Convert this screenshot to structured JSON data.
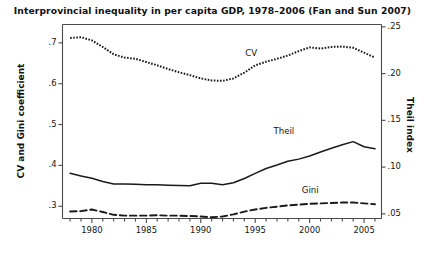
{
  "chart_data": {
    "type": "line",
    "title": "Interprovincial inequality in per capita GDP, 1978–2006 (Fan and Sun 2007)",
    "xlabel": "",
    "ylabel": "CV and Gini coefficient",
    "ylabel_right": "Theil index",
    "xlim": [
      1977.3,
      2006.6
    ],
    "ylim": [
      0.27,
      0.745
    ],
    "ylim_right": [
      0.045,
      0.2525
    ],
    "grid": false,
    "legend": "inline-labels",
    "x": [
      1978,
      1979,
      1980,
      1981,
      1982,
      1983,
      1984,
      1985,
      1986,
      1987,
      1988,
      1989,
      1990,
      1991,
      1992,
      1993,
      1994,
      1995,
      1996,
      1997,
      1998,
      1999,
      2000,
      2001,
      2002,
      2003,
      2004,
      2005,
      2006
    ],
    "xticks_major": [
      1980,
      1985,
      1990,
      1995,
      2000,
      2005
    ],
    "xticks_minor_step": 1,
    "yticks_left": [
      0.3,
      0.4,
      0.5,
      0.6,
      0.7
    ],
    "ytick_labels_left": [
      ".3",
      ".4",
      ".5",
      ".6",
      ".7"
    ],
    "yticks_right": [
      0.05,
      0.1,
      0.15,
      0.2,
      0.25
    ],
    "ytick_labels_right": [
      ".05",
      ".10",
      ".15",
      ".20",
      ".25"
    ],
    "series": [
      {
        "name": "CV",
        "axis": "left",
        "style": "dotted",
        "label_x": 1995.0,
        "label_y": 0.672,
        "values": [
          0.712,
          0.714,
          0.706,
          0.69,
          0.672,
          0.664,
          0.661,
          0.653,
          0.645,
          0.636,
          0.628,
          0.621,
          0.613,
          0.608,
          0.607,
          0.613,
          0.627,
          0.645,
          0.654,
          0.661,
          0.669,
          0.68,
          0.689,
          0.686,
          0.69,
          0.691,
          0.688,
          0.676,
          0.664
        ]
      },
      {
        "name": "Theil",
        "axis": "right",
        "style": "solid",
        "label_x": 1997.6,
        "label_y": 0.137,
        "values": [
          0.0935,
          0.0905,
          0.088,
          0.0845,
          0.082,
          0.0818,
          0.0815,
          0.0812,
          0.081,
          0.0806,
          0.0802,
          0.08,
          0.0828,
          0.0826,
          0.0812,
          0.0832,
          0.0878,
          0.0932,
          0.0985,
          0.1022,
          0.1062,
          0.1085,
          0.1118,
          0.1162,
          0.1202,
          0.1238,
          0.1272,
          0.1218,
          0.1195
        ]
      },
      {
        "name": "Gini",
        "axis": "left",
        "style": "dashed",
        "label_x": 2000.2,
        "label_y": 0.337,
        "values": [
          0.287,
          0.288,
          0.292,
          0.286,
          0.279,
          0.277,
          0.277,
          0.277,
          0.278,
          0.277,
          0.277,
          0.276,
          0.275,
          0.273,
          0.275,
          0.28,
          0.287,
          0.292,
          0.296,
          0.299,
          0.302,
          0.304,
          0.306,
          0.307,
          0.308,
          0.309,
          0.309,
          0.307,
          0.305
        ]
      }
    ]
  }
}
